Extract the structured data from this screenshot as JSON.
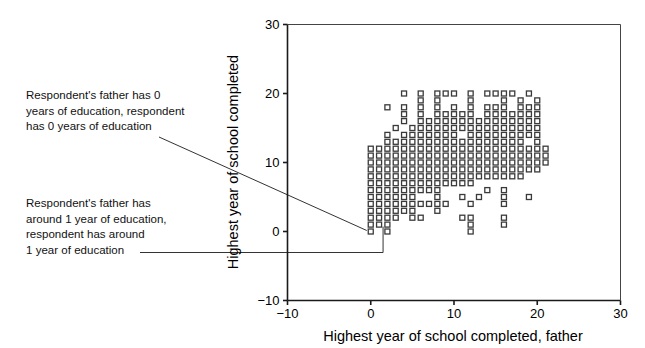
{
  "chart_data": {
    "type": "scatter",
    "title": "",
    "xlabel": "Highest year of school completed, father",
    "ylabel": "Highest year of school completed",
    "xlim": [
      -10,
      30
    ],
    "ylim": [
      -10,
      30
    ],
    "xticks": [
      -10,
      0,
      10,
      20,
      30
    ],
    "yticks": [
      -10,
      0,
      10,
      20,
      30
    ],
    "xtick_labels": [
      "−10",
      "0",
      "10",
      "20",
      "30"
    ],
    "ytick_labels": [
      "−10",
      "0",
      "10",
      "20",
      "30"
    ],
    "grid": false,
    "legend": null,
    "marker": "open-square",
    "marker_size_px": 5,
    "marker_color": "#3a3a3a",
    "points": [
      [
        0,
        0
      ],
      [
        1,
        1
      ],
      [
        2,
        2
      ],
      [
        3,
        3
      ],
      [
        0,
        2
      ],
      [
        1,
        2
      ],
      [
        0,
        3
      ],
      [
        1,
        3
      ],
      [
        2,
        3
      ],
      [
        0,
        4
      ],
      [
        1,
        4
      ],
      [
        2,
        4
      ],
      [
        3,
        4
      ],
      [
        4,
        4
      ],
      [
        0,
        5
      ],
      [
        1,
        5
      ],
      [
        2,
        5
      ],
      [
        3,
        5
      ],
      [
        4,
        5
      ],
      [
        5,
        5
      ],
      [
        0,
        6
      ],
      [
        1,
        6
      ],
      [
        2,
        6
      ],
      [
        3,
        6
      ],
      [
        4,
        6
      ],
      [
        5,
        6
      ],
      [
        6,
        6
      ],
      [
        7,
        6
      ],
      [
        8,
        6
      ],
      [
        0,
        7
      ],
      [
        1,
        7
      ],
      [
        2,
        7
      ],
      [
        3,
        7
      ],
      [
        4,
        7
      ],
      [
        5,
        7
      ],
      [
        6,
        7
      ],
      [
        7,
        7
      ],
      [
        8,
        7
      ],
      [
        9,
        7
      ],
      [
        10,
        7
      ],
      [
        11,
        7
      ],
      [
        12,
        7
      ],
      [
        0,
        8
      ],
      [
        1,
        8
      ],
      [
        2,
        8
      ],
      [
        3,
        8
      ],
      [
        4,
        8
      ],
      [
        5,
        8
      ],
      [
        6,
        8
      ],
      [
        7,
        8
      ],
      [
        8,
        8
      ],
      [
        9,
        8
      ],
      [
        10,
        8
      ],
      [
        11,
        8
      ],
      [
        12,
        8
      ],
      [
        13,
        8
      ],
      [
        14,
        8
      ],
      [
        15,
        8
      ],
      [
        16,
        8
      ],
      [
        17,
        8
      ],
      [
        18,
        8
      ],
      [
        0,
        9
      ],
      [
        1,
        9
      ],
      [
        2,
        9
      ],
      [
        3,
        9
      ],
      [
        4,
        9
      ],
      [
        5,
        9
      ],
      [
        6,
        9
      ],
      [
        7,
        9
      ],
      [
        8,
        9
      ],
      [
        9,
        9
      ],
      [
        10,
        9
      ],
      [
        11,
        9
      ],
      [
        12,
        9
      ],
      [
        13,
        9
      ],
      [
        14,
        9
      ],
      [
        15,
        9
      ],
      [
        16,
        9
      ],
      [
        17,
        9
      ],
      [
        18,
        9
      ],
      [
        19,
        9
      ],
      [
        20,
        9
      ],
      [
        0,
        10
      ],
      [
        1,
        10
      ],
      [
        2,
        10
      ],
      [
        3,
        10
      ],
      [
        4,
        10
      ],
      [
        5,
        10
      ],
      [
        6,
        10
      ],
      [
        7,
        10
      ],
      [
        8,
        10
      ],
      [
        9,
        10
      ],
      [
        10,
        10
      ],
      [
        11,
        10
      ],
      [
        12,
        10
      ],
      [
        13,
        10
      ],
      [
        14,
        10
      ],
      [
        15,
        10
      ],
      [
        16,
        10
      ],
      [
        17,
        10
      ],
      [
        18,
        10
      ],
      [
        19,
        10
      ],
      [
        20,
        10
      ],
      [
        21,
        10
      ],
      [
        0,
        11
      ],
      [
        1,
        11
      ],
      [
        2,
        11
      ],
      [
        3,
        11
      ],
      [
        4,
        11
      ],
      [
        5,
        11
      ],
      [
        6,
        11
      ],
      [
        7,
        11
      ],
      [
        8,
        11
      ],
      [
        9,
        11
      ],
      [
        10,
        11
      ],
      [
        11,
        11
      ],
      [
        12,
        11
      ],
      [
        13,
        11
      ],
      [
        14,
        11
      ],
      [
        15,
        11
      ],
      [
        16,
        11
      ],
      [
        17,
        11
      ],
      [
        18,
        11
      ],
      [
        19,
        11
      ],
      [
        20,
        11
      ],
      [
        21,
        11
      ],
      [
        0,
        12
      ],
      [
        1,
        12
      ],
      [
        2,
        12
      ],
      [
        3,
        12
      ],
      [
        4,
        12
      ],
      [
        5,
        12
      ],
      [
        6,
        12
      ],
      [
        7,
        12
      ],
      [
        8,
        12
      ],
      [
        9,
        12
      ],
      [
        10,
        12
      ],
      [
        11,
        12
      ],
      [
        12,
        12
      ],
      [
        13,
        12
      ],
      [
        14,
        12
      ],
      [
        15,
        12
      ],
      [
        16,
        12
      ],
      [
        17,
        12
      ],
      [
        18,
        12
      ],
      [
        19,
        12
      ],
      [
        20,
        12
      ],
      [
        21,
        12
      ],
      [
        2,
        13
      ],
      [
        3,
        13
      ],
      [
        4,
        13
      ],
      [
        5,
        13
      ],
      [
        6,
        13
      ],
      [
        7,
        13
      ],
      [
        8,
        13
      ],
      [
        9,
        13
      ],
      [
        10,
        13
      ],
      [
        11,
        13
      ],
      [
        12,
        13
      ],
      [
        13,
        13
      ],
      [
        14,
        13
      ],
      [
        15,
        13
      ],
      [
        16,
        13
      ],
      [
        17,
        13
      ],
      [
        18,
        13
      ],
      [
        20,
        13
      ],
      [
        2,
        14
      ],
      [
        4,
        14
      ],
      [
        5,
        14
      ],
      [
        6,
        14
      ],
      [
        7,
        14
      ],
      [
        8,
        14
      ],
      [
        9,
        14
      ],
      [
        10,
        14
      ],
      [
        12,
        14
      ],
      [
        13,
        14
      ],
      [
        14,
        14
      ],
      [
        15,
        14
      ],
      [
        16,
        14
      ],
      [
        17,
        14
      ],
      [
        18,
        14
      ],
      [
        19,
        14
      ],
      [
        20,
        14
      ],
      [
        3,
        15
      ],
      [
        5,
        15
      ],
      [
        6,
        15
      ],
      [
        7,
        15
      ],
      [
        8,
        15
      ],
      [
        9,
        15
      ],
      [
        10,
        15
      ],
      [
        11,
        15
      ],
      [
        12,
        15
      ],
      [
        13,
        15
      ],
      [
        14,
        15
      ],
      [
        15,
        15
      ],
      [
        16,
        15
      ],
      [
        17,
        15
      ],
      [
        18,
        15
      ],
      [
        19,
        15
      ],
      [
        20,
        15
      ],
      [
        4,
        16
      ],
      [
        6,
        16
      ],
      [
        7,
        16
      ],
      [
        8,
        16
      ],
      [
        9,
        16
      ],
      [
        10,
        16
      ],
      [
        11,
        16
      ],
      [
        12,
        16
      ],
      [
        13,
        16
      ],
      [
        14,
        16
      ],
      [
        15,
        16
      ],
      [
        16,
        16
      ],
      [
        17,
        16
      ],
      [
        18,
        16
      ],
      [
        19,
        16
      ],
      [
        20,
        16
      ],
      [
        4,
        17
      ],
      [
        6,
        17
      ],
      [
        8,
        17
      ],
      [
        9,
        17
      ],
      [
        10,
        17
      ],
      [
        11,
        17
      ],
      [
        12,
        17
      ],
      [
        14,
        17
      ],
      [
        15,
        17
      ],
      [
        16,
        17
      ],
      [
        17,
        17
      ],
      [
        18,
        17
      ],
      [
        19,
        17
      ],
      [
        20,
        17
      ],
      [
        2,
        18
      ],
      [
        4,
        18
      ],
      [
        6,
        18
      ],
      [
        8,
        18
      ],
      [
        10,
        18
      ],
      [
        12,
        18
      ],
      [
        14,
        18
      ],
      [
        15,
        18
      ],
      [
        16,
        18
      ],
      [
        18,
        18
      ],
      [
        19,
        18
      ],
      [
        20,
        18
      ],
      [
        6,
        19
      ],
      [
        8,
        19
      ],
      [
        12,
        19
      ],
      [
        16,
        19
      ],
      [
        18,
        19
      ],
      [
        20,
        19
      ],
      [
        4,
        20
      ],
      [
        6,
        20
      ],
      [
        8,
        20
      ],
      [
        9,
        20
      ],
      [
        10,
        20
      ],
      [
        12,
        20
      ],
      [
        14,
        20
      ],
      [
        15,
        20
      ],
      [
        16,
        20
      ],
      [
        17,
        20
      ],
      [
        19,
        20
      ],
      [
        1,
        1
      ],
      [
        2,
        1
      ],
      [
        3,
        2
      ],
      [
        5,
        2
      ],
      [
        6,
        2
      ],
      [
        8,
        3
      ],
      [
        11,
        2
      ],
      [
        12,
        2
      ],
      [
        12,
        1
      ],
      [
        16,
        2
      ],
      [
        2,
        4
      ],
      [
        4,
        3
      ],
      [
        5,
        3
      ],
      [
        6,
        4
      ],
      [
        8,
        4
      ],
      [
        8,
        5
      ],
      [
        12,
        4
      ],
      [
        13,
        5
      ],
      [
        16,
        4
      ],
      [
        16,
        5
      ],
      [
        19,
        5
      ],
      [
        3,
        6
      ],
      [
        5,
        4
      ],
      [
        7,
        4
      ],
      [
        9,
        4
      ],
      [
        11,
        5
      ],
      [
        14,
        6
      ],
      [
        16,
        6
      ],
      [
        0,
        1
      ],
      [
        2,
        0
      ],
      [
        12,
        0
      ],
      [
        16,
        1
      ]
    ]
  },
  "annotations": [
    {
      "id": "origin",
      "text": "Respondent's father has 0\nyears of education, respondent\nhas 0 years of education",
      "points_to": [
        0,
        0
      ]
    },
    {
      "id": "one",
      "text": "Respondent's father has\naround 1 year of education,\nrespondent has around\n1 year of education",
      "points_to": [
        1,
        1
      ]
    }
  ]
}
